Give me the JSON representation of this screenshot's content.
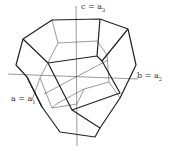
{
  "diagram": {
    "axes": [
      {
        "id": "c",
        "label": "c = a",
        "subscript": "3"
      },
      {
        "id": "b",
        "label": "b = a",
        "subscript": "2"
      },
      {
        "id": "a",
        "label": "a = a",
        "subscript": "1"
      }
    ],
    "colors": {
      "thick": "#222222",
      "thin": "#555555"
    }
  }
}
